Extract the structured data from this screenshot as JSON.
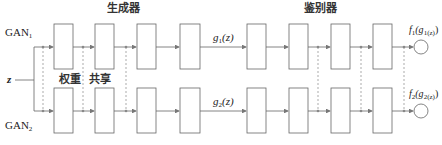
{
  "labels": {
    "gan1_prefix": "GAN",
    "gan1_sub": "1",
    "gan2_prefix": "GAN",
    "gan2_sub": "2",
    "input": "z",
    "generator": "生成器",
    "discriminator": "鉴别器",
    "weight": "权重",
    "shared": "共享",
    "g1_fn": "g",
    "g1_sub": "1",
    "g1_arg": "(z)",
    "g2_fn": "g",
    "g2_sub": "2",
    "g2_arg": "(z)",
    "f1_fn": "f",
    "f1_sub": "1",
    "f1_arg_open": "(g",
    "f1_arg_sub": "1(z)",
    "f1_arg_close": ")",
    "f2_fn": "f",
    "f2_sub": "2",
    "f2_arg_open": "(g",
    "f2_arg_sub": "2(z)",
    "f2_arg_close": ")"
  },
  "colors": {
    "stroke": "#666666",
    "dashed": "#888888",
    "text": "#222222"
  },
  "generator_layers": 4,
  "discriminator_layers": 4
}
